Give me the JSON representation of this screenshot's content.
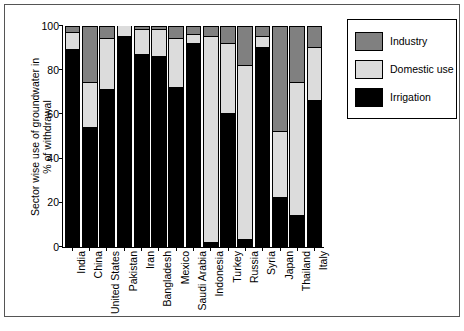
{
  "chart_data": {
    "type": "bar",
    "stacked": true,
    "title": "",
    "xlabel": "",
    "ylabel": "Sector wise use of groundwater in % of withdrawal",
    "ylabel_line1": "Sector wise use of groundwater in",
    "ylabel_line2": "% of withdrawal",
    "ylim": [
      0,
      100
    ],
    "yticks": [
      0,
      20,
      40,
      60,
      80,
      100
    ],
    "ytick_labels": [
      "0",
      "20",
      "40",
      "60",
      "80",
      "100"
    ],
    "grid": false,
    "legend_position": "top-right",
    "categories": [
      "India",
      "China",
      "United States",
      "Pakistan",
      "Iran",
      "Bangladesh",
      "Mexico",
      "Saudi Arabia",
      "Indonesia",
      "Turkey",
      "Russia",
      "Syria",
      "Japan",
      "Thailand",
      "Italy"
    ],
    "series": [
      {
        "name": "Irrigation",
        "color": "#000000",
        "values": [
          89,
          54,
          71,
          95,
          87,
          86,
          72,
          92,
          2,
          60,
          3,
          90,
          22,
          14,
          66
        ]
      },
      {
        "name": "Domestic use",
        "color": "#dcdcdc",
        "values": [
          8,
          20,
          23,
          5,
          11,
          12,
          22,
          4,
          93,
          32,
          79,
          5,
          30,
          60,
          24
        ]
      },
      {
        "name": "Industry",
        "color": "#808080",
        "values": [
          3,
          26,
          6,
          0,
          2,
          2,
          6,
          4,
          5,
          8,
          18,
          5,
          48,
          26,
          10
        ]
      }
    ],
    "legend": [
      {
        "label": "Industry",
        "color": "#808080"
      },
      {
        "label": "Domestic use",
        "color": "#dcdcdc"
      },
      {
        "label": "Irrigation",
        "color": "#000000"
      }
    ]
  }
}
